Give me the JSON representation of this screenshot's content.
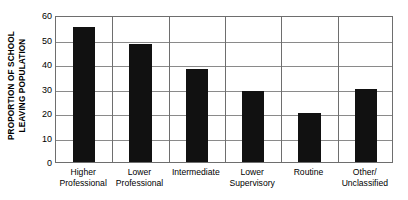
{
  "chart_data": {
    "type": "bar",
    "title": "",
    "xlabel": "",
    "ylabel": "PROPORTION OF SCHOOL LEAVING POPULATION",
    "ylabel_lines": [
      "PROPORTION OF SCHOOL",
      "LEAVING POPULATION"
    ],
    "categories": [
      "Higher Professional",
      "Lower Professional",
      "Intermediate",
      "Lower Supervisory",
      "Routine",
      "Other/ Unclassified"
    ],
    "category_lines": [
      [
        "Higher",
        "Professional"
      ],
      [
        "Lower",
        "Professional"
      ],
      [
        "Intermediate",
        ""
      ],
      [
        "Lower",
        "Supervisory"
      ],
      [
        "Routine",
        ""
      ],
      [
        "Other/",
        "Unclassified"
      ]
    ],
    "values": [
      55,
      48,
      38,
      29,
      20,
      30
    ],
    "ylim": [
      0,
      60
    ],
    "yticks": [
      0,
      10,
      20,
      30,
      40,
      50,
      60
    ],
    "ytick_labels": [
      "0",
      "10",
      "20",
      "30",
      "40",
      "50",
      "60"
    ],
    "grid": "horizontal-and-vertical",
    "legend": "none",
    "bar_color": "#111111",
    "grid_color": "#8a8a8a",
    "frame_color": "#6e6e6e"
  }
}
